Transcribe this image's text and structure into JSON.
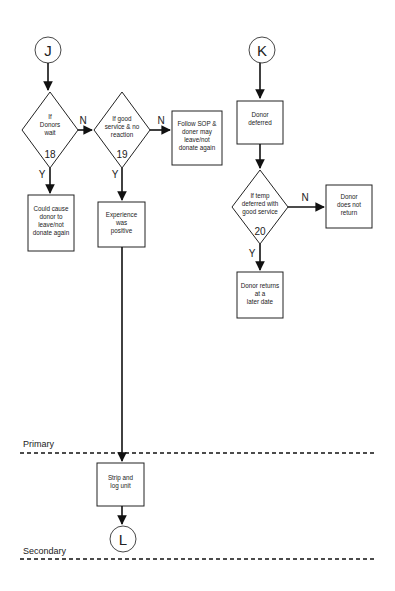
{
  "connectors": {
    "J": "J",
    "K": "K",
    "L": "L"
  },
  "decisions": {
    "d18": {
      "lines": [
        "If",
        "Donors",
        "wait"
      ],
      "number": "18",
      "yes": "Y",
      "no": "N"
    },
    "d19": {
      "lines": [
        "If good",
        "service & no",
        "reaction"
      ],
      "number": "19",
      "yes": "Y",
      "no": "N"
    },
    "d20": {
      "lines": [
        "If temp",
        "deferred with",
        "good service"
      ],
      "number": "20",
      "yes": "Y",
      "no": "N"
    }
  },
  "processes": {
    "follow_sop": [
      "Follow SOP &",
      "doner may",
      "leave/not",
      "donate again"
    ],
    "could_cause": [
      "Could cause",
      "donor to",
      "leave/not",
      "donate again"
    ],
    "experience": [
      "Experience",
      "was",
      "positive"
    ],
    "donor_deferred": [
      "Donor",
      "deferred"
    ],
    "does_not_return": [
      "Donor",
      "does not",
      "return"
    ],
    "returns_later": [
      "Donor returns",
      "at a",
      "later date"
    ],
    "strip_log": [
      "Strip and",
      "log unit"
    ]
  },
  "lanes": {
    "primary": "Primary",
    "secondary": "Secondary"
  },
  "colors": {
    "line": "#111111",
    "background": "#ffffff"
  }
}
